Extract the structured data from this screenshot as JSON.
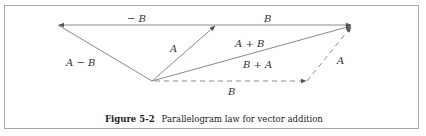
{
  "figure": {
    "caption_label": "Figure 5-2",
    "caption_text": "Parallelogram law for vector addition"
  },
  "vectors": {
    "neg_b": "− B",
    "b_top": "B",
    "a_left": "A",
    "a_minus_b": "A − B",
    "a_plus_b": "A + B",
    "b_plus_a": "B + A",
    "a_right": "A",
    "b_bottom": "B"
  },
  "colors": {
    "line": "#8a8a8a",
    "frame": "#a8a8a8",
    "text": "#333333"
  }
}
